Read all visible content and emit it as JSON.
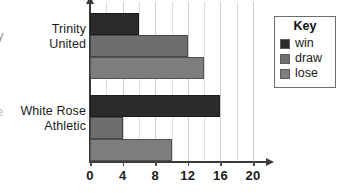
{
  "chart_data": {
    "type": "bar",
    "orientation": "horizontal",
    "title": "",
    "xlabel": "",
    "ylabel": "",
    "categories": [
      "Trinity United",
      "White Rose Athletic"
    ],
    "category_lines": [
      [
        "Trinity",
        "United"
      ],
      [
        "White Rose",
        "Athletic"
      ]
    ],
    "series": [
      {
        "name": "win",
        "color": "#2b2b2b",
        "values": [
          6,
          16
        ]
      },
      {
        "name": "draw",
        "color": "#6e6e6e",
        "values": [
          12,
          4
        ]
      },
      {
        "name": "lose",
        "color": "#7d7d7d",
        "values": [
          14,
          10
        ]
      }
    ],
    "xlim": [
      0,
      20
    ],
    "xticks": [
      0,
      4,
      8,
      12,
      16,
      20
    ],
    "xtick_labels": [
      "0",
      "4",
      "8",
      "12",
      "16",
      "20"
    ],
    "minor_gridline_step": 2,
    "grid": true,
    "legend_position": "right"
  },
  "legend": {
    "title": "Key",
    "entries": [
      {
        "label": "win",
        "color": "#2b2b2b"
      },
      {
        "label": "draw",
        "color": "#6e6e6e"
      },
      {
        "label": "lose",
        "color": "#7d7d7d"
      }
    ]
  },
  "edge_glyphs": {
    "top": "y",
    "bottom": "e"
  }
}
